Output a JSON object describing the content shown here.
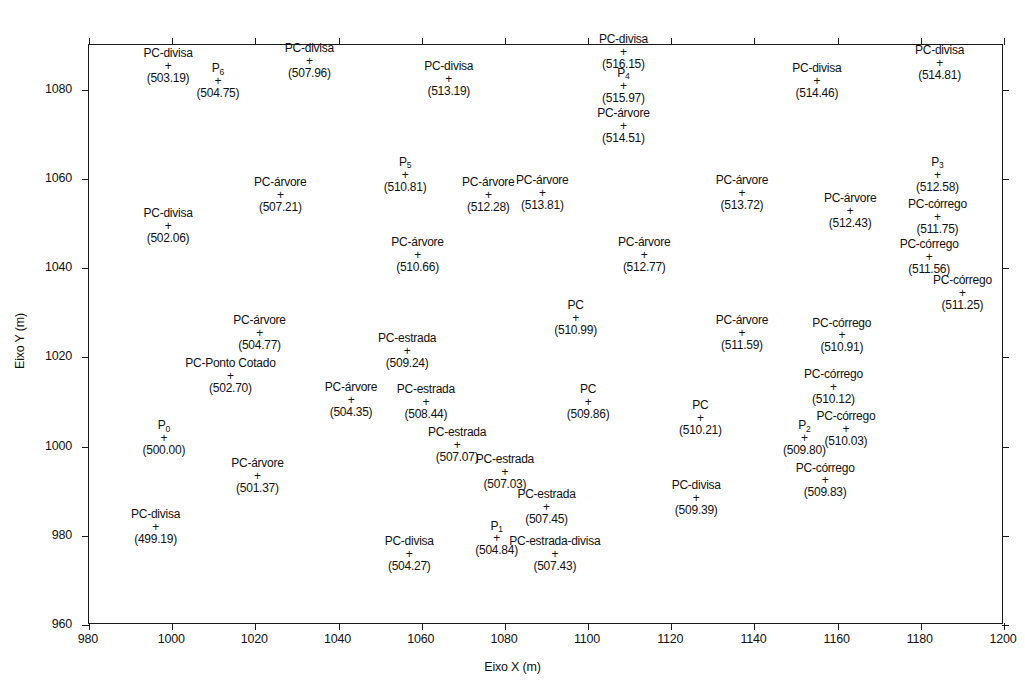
{
  "figure": {
    "kind": "scatter-survey-plot",
    "background": "#ffffff",
    "ink_color": "#111111"
  },
  "axes": {
    "x": {
      "title": "Eixo X (m)",
      "min": 980,
      "max": 1200,
      "step": 20,
      "ticks": [
        "980",
        "1000",
        "1020",
        "1040",
        "1060",
        "1080",
        "1100",
        "1120",
        "1140",
        "1160",
        "1180",
        "1200"
      ]
    },
    "y": {
      "title": "Eixo Y (m)",
      "min": 960,
      "max": 1090,
      "step": 20,
      "ticks": [
        "960",
        "980",
        "1000",
        "1020",
        "1040",
        "1060",
        "1080"
      ]
    }
  },
  "marker_glyph": "+",
  "chart_data": {
    "type": "scatter",
    "title": "",
    "xlabel": "Eixo X (m)",
    "ylabel": "Eixo Y (m)",
    "xlim": [
      980,
      1200
    ],
    "ylim": [
      960,
      1090
    ],
    "grid": false,
    "legend": "none",
    "point_label_format": "name above marker, elevation in parentheses below marker",
    "points": [
      {
        "name": "PC-divisa",
        "value": "(503.19)",
        "x": 999,
        "y": 1086.5,
        "align": "center"
      },
      {
        "name": "P",
        "sub": "6",
        "value": "(504.75)",
        "x": 1011,
        "y": 1083.0,
        "align": "center"
      },
      {
        "name": "PC-divisa",
        "value": "(507.96)",
        "x": 1033,
        "y": 1087.5,
        "align": "center"
      },
      {
        "name": "PC-divisa",
        "value": "(513.19)",
        "x": 1066.5,
        "y": 1083.5,
        "align": "center"
      },
      {
        "name": "PC-divisa",
        "value": "(516.15)",
        "x": 1108.5,
        "y": 1089.5,
        "align": "center"
      },
      {
        "name": "P",
        "sub": "4",
        "value": "(515.97)",
        "x": 1108.5,
        "y": 1082.0,
        "align": "center"
      },
      {
        "name": "PC-divisa",
        "value": "(514.46)",
        "x": 1155,
        "y": 1083.0,
        "align": "center"
      },
      {
        "name": "PC-divisa",
        "value": "(514.81)",
        "x": 1184.5,
        "y": 1087.0,
        "align": "center"
      },
      {
        "name": "PC-árvore",
        "value": "(514.51)",
        "x": 1108.5,
        "y": 1073.0,
        "align": "center"
      },
      {
        "name": "P",
        "sub": "5",
        "value": "(510.81)",
        "x": 1056,
        "y": 1062.0,
        "align": "center"
      },
      {
        "name": "P",
        "sub": "3",
        "value": "(512.58)",
        "x": 1184,
        "y": 1062.0,
        "align": "center"
      },
      {
        "name": "PC-árvore",
        "value": "(507.21)",
        "x": 1026,
        "y": 1057.5,
        "align": "center"
      },
      {
        "name": "PC-árvore",
        "value": "(512.28)",
        "x": 1076,
        "y": 1057.5,
        "align": "center"
      },
      {
        "name": "PC-árvore",
        "value": "(513.81)",
        "x": 1089,
        "y": 1058.0,
        "align": "center"
      },
      {
        "name": "PC-árvore",
        "value": "(513.72)",
        "x": 1137,
        "y": 1058.0,
        "align": "center"
      },
      {
        "name": "PC-divisa",
        "value": "(502.06)",
        "x": 999,
        "y": 1050.5,
        "align": "center"
      },
      {
        "name": "PC-árvore",
        "value": "(512.43)",
        "x": 1163,
        "y": 1054.0,
        "align": "center"
      },
      {
        "name": "PC-córrego",
        "value": "(511.75)",
        "x": 1184,
        "y": 1052.5,
        "align": "center"
      },
      {
        "name": "PC-árvore",
        "value": "(510.66)",
        "x": 1059,
        "y": 1044.0,
        "align": "center"
      },
      {
        "name": "PC-árvore",
        "value": "(512.77)",
        "x": 1113.5,
        "y": 1044.0,
        "align": "center"
      },
      {
        "name": "PC-córrego",
        "value": "(511.56)",
        "x": 1182,
        "y": 1043.5,
        "align": "center"
      },
      {
        "name": "PC-córrego",
        "value": "(511.25)",
        "x": 1190,
        "y": 1035.5,
        "align": "center"
      },
      {
        "name": "PC",
        "value": "(510.99)",
        "x": 1097,
        "y": 1030.0,
        "align": "center"
      },
      {
        "name": "PC-árvore",
        "value": "(511.59)",
        "x": 1137,
        "y": 1026.5,
        "align": "center"
      },
      {
        "name": "PC-árvore",
        "value": "(504.77)",
        "x": 1021,
        "y": 1026.5,
        "align": "center"
      },
      {
        "name": "PC-córrego",
        "value": "(510.91)",
        "x": 1161,
        "y": 1026.0,
        "align": "center"
      },
      {
        "name": "PC-estrada",
        "value": "(509.24)",
        "x": 1056.5,
        "y": 1022.5,
        "align": "center"
      },
      {
        "name": "PC-Ponto Cotado",
        "value": "(502.70)",
        "x": 1014,
        "y": 1017.0,
        "align": "center"
      },
      {
        "name": "PC-córrego",
        "value": "(510.12)",
        "x": 1159,
        "y": 1014.5,
        "align": "center"
      },
      {
        "name": "PC-árvore",
        "value": "(504.35)",
        "x": 1043,
        "y": 1011.5,
        "align": "center"
      },
      {
        "name": "PC-estrada",
        "value": "(508.44)",
        "x": 1061,
        "y": 1011.0,
        "align": "center"
      },
      {
        "name": "PC",
        "value": "(509.86)",
        "x": 1100,
        "y": 1011.0,
        "align": "center"
      },
      {
        "name": "PC",
        "value": "(510.21)",
        "x": 1127,
        "y": 1007.5,
        "align": "center"
      },
      {
        "name": "PC-córrego",
        "value": "(510.03)",
        "x": 1162,
        "y": 1005.0,
        "align": "center"
      },
      {
        "name": "P",
        "sub": "0",
        "value": "(500.00)",
        "x": 998,
        "y": 1003.0,
        "align": "center"
      },
      {
        "name": "P",
        "sub": "2",
        "value": "(509.80)",
        "x": 1152,
        "y": 1003.0,
        "align": "center"
      },
      {
        "name": "PC-estrada",
        "value": "(507.07)",
        "x": 1068.5,
        "y": 1001.5,
        "align": "center"
      },
      {
        "name": "PC-árvore",
        "value": "(501.37)",
        "x": 1020.5,
        "y": 994.5,
        "align": "center"
      },
      {
        "name": "PC-estrada",
        "value": "(507.03)",
        "x": 1080,
        "y": 995.5,
        "align": "center"
      },
      {
        "name": "PC-córrego",
        "value": "(509.83)",
        "x": 1157,
        "y": 993.5,
        "align": "center"
      },
      {
        "name": "PC-divisa",
        "value": "(509.39)",
        "x": 1126,
        "y": 989.5,
        "align": "center"
      },
      {
        "name": "PC-estrada",
        "value": "(507.45)",
        "x": 1090,
        "y": 987.5,
        "align": "center"
      },
      {
        "name": "PC-divisa",
        "value": "(499.19)",
        "x": 996,
        "y": 983.0,
        "align": "center"
      },
      {
        "name": "P",
        "sub": "1",
        "value": "(504.84)",
        "x": 1078,
        "y": 980.5,
        "align": "center"
      },
      {
        "name": "PC-estrada-divisa",
        "value": "(507.43)",
        "x": 1092,
        "y": 977.0,
        "align": "center"
      },
      {
        "name": "PC-divisa",
        "value": "(504.27)",
        "x": 1057,
        "y": 977.0,
        "align": "center"
      }
    ]
  }
}
